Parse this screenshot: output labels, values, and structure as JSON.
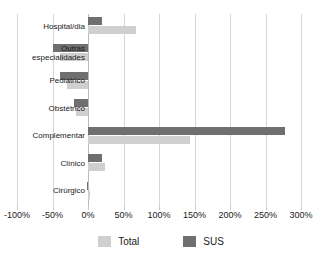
{
  "chart_data": {
    "type": "bar",
    "orientation": "horizontal",
    "title": "",
    "subtitle": "",
    "xlabel": "",
    "ylabel": "",
    "xlim": [
      -100,
      300
    ],
    "xtick_values": [
      -100,
      -50,
      0,
      50,
      100,
      150,
      200,
      250,
      300
    ],
    "xtick_labels": [
      "-100%",
      "-50%",
      "0%",
      "50%",
      "100%",
      "150%",
      "200%",
      "250%",
      "300%"
    ],
    "grid": true,
    "grid_axis": "x",
    "legend_position": "bottom",
    "categories": [
      "Hospital/dia",
      "Outras\nespecialidades",
      "Pediátrico",
      "Obstétrico",
      "Complementar",
      "Clínico",
      "Cirúrgico"
    ],
    "series": [
      {
        "name": "SUS",
        "color": "#6f6f6f",
        "values": [
          20,
          -50,
          -40,
          -20,
          277,
          20,
          -2
        ]
      },
      {
        "name": "Total",
        "color": "#cfcfcf",
        "values": [
          67,
          -39,
          -30,
          -17,
          143,
          24,
          3
        ]
      }
    ],
    "legend": [
      {
        "label": "Total",
        "color": "#cfcfcf"
      },
      {
        "label": "SUS",
        "color": "#6f6f6f"
      }
    ]
  }
}
